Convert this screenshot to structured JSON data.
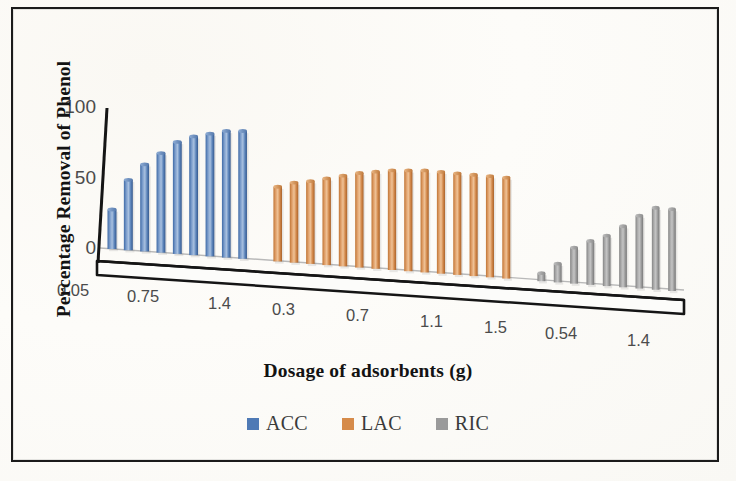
{
  "figure": {
    "background": "#fdfdfb",
    "border_color": "#1b1b1b"
  },
  "axes": {
    "ytitle": "Percentage Removal of Phenol",
    "xtitle": "Dosage of adsorbents (g)",
    "yticks": [
      "100",
      "50",
      "0"
    ],
    "ytick_values": [
      100,
      50,
      0
    ],
    "ylim": [
      0,
      100
    ],
    "xticks": [
      "0.05",
      "0.75",
      "1.4",
      "0.3",
      "0.7",
      "1.1",
      "1.5",
      "0.54",
      "1.4"
    ],
    "grid": false
  },
  "legend": {
    "position": "bottom-center",
    "items": [
      {
        "label": "ACC",
        "color": "#4f7ab5"
      },
      {
        "label": "LAC",
        "color": "#d68b4a"
      },
      {
        "label": "RIC",
        "color": "#9a9a9a"
      }
    ]
  },
  "chart_data": {
    "type": "bar",
    "title": "",
    "subtitle": "",
    "xlabel": "Dosage of adsorbents (g)",
    "ylabel": "Percentage Removal of Phenol",
    "ylim": [
      0,
      100
    ],
    "yticks": [
      0,
      50,
      100
    ],
    "grid": false,
    "legend_position": "bottom-center",
    "style": "3d-clustered-column",
    "note": "Three adsorbent series plotted side by side along a single receding 3D category axis; each series has its own dosage sequence.",
    "series": [
      {
        "name": "ACC",
        "color": "#4f7ab5",
        "categories": [
          "0.05",
          "0.2",
          "0.4",
          "0.6",
          "0.75",
          "0.9",
          "1.1",
          "1.25",
          "1.4"
        ],
        "values": [
          28,
          50,
          62,
          71,
          80,
          85,
          88,
          91,
          92
        ]
      },
      {
        "name": "LAC",
        "color": "#d68b4a",
        "categories": [
          "0.3",
          "0.4",
          "0.5",
          "0.6",
          "0.7",
          "0.8",
          "0.9",
          "1.0",
          "1.1",
          "1.2",
          "1.3",
          "1.4",
          "1.45",
          "1.5",
          "1.55"
        ],
        "values": [
          54,
          58,
          60,
          63,
          66,
          69,
          71,
          73,
          74,
          75,
          75,
          75,
          75,
          75,
          75
        ]
      },
      {
        "name": "RIC",
        "color": "#9a9a9a",
        "categories": [
          "0.3",
          "0.42",
          "0.54",
          "0.66",
          "0.78",
          "0.9",
          "1.1",
          "1.25",
          "1.4"
        ],
        "values": [
          6,
          14,
          27,
          33,
          38,
          46,
          55,
          62,
          62
        ]
      }
    ]
  }
}
